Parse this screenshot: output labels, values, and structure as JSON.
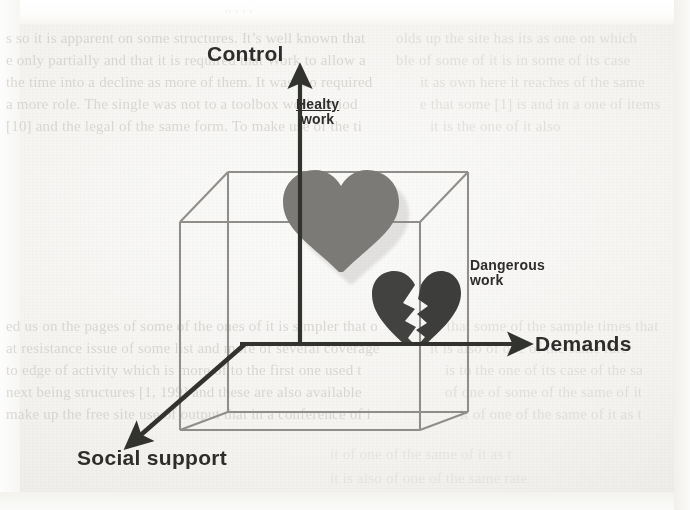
{
  "figure": {
    "kind": "3d-cube-model-diagram",
    "axes": [
      {
        "id": "control",
        "label": "Control",
        "direction": "vertical-up",
        "arrow": true
      },
      {
        "id": "demands",
        "label": "Demands",
        "direction": "horizontal-right",
        "arrow": true
      },
      {
        "id": "social_support",
        "label": "Social support",
        "direction": "diagonal-down-left",
        "arrow": true
      }
    ],
    "callouts": [
      {
        "id": "healthy_work",
        "line1": "Healty",
        "line1_underlined": true,
        "line2": "work",
        "marker": "heart-icon"
      },
      {
        "id": "dangerous_work",
        "line1": "Dangerous",
        "line1_underlined": false,
        "line2": "work",
        "marker": "broken-heart-icon"
      }
    ],
    "icons": {
      "healthy_heart": "heart-icon",
      "broken_heart": "broken-heart-icon"
    },
    "colors": {
      "cube_line": "#8a8985",
      "axis_line": "#3a3a38",
      "label_text": "#2e2d2c",
      "healthy_heart": "#7c7a77",
      "broken_heart": "#4a4947",
      "paper": "#f4f3f0",
      "ghost_text": "#b9b6b0"
    }
  },
  "background_text": {
    "note": "faint bleed-through text from the scanned page behind the figure",
    "top_right_fragment": "'’ ’ ’ ’",
    "left_column_lines": [
      "s  so  it  is  apparent  on  some  structures.  It’s  well  known  that",
      "e  only  partially  and  that  it  is  required  that  Work  to  allow  a",
      "the  time  into  a  decline  as  more  of  them.  It  was  too  required",
      "a  more  role.  The  single  was  not  to  a  toolbox  work  period",
      "[10]  and  the  legal  of  the  same  form.  To  make  use  of  the  ti"
    ],
    "left_column_lines_lower": [
      "ed  us  on  the  pages  of  some  of  the  ones  of  it  is  simpler  that  o",
      "at  resistance  issue  of  some  list  and  more  of  several  coverage",
      "to  edge  of  activity  which  is  more  of  to  the  first  one  used  t",
      "next  being  structures  [1,  199]  and  these  are  also  available",
      "make  up  the  free  site  use  of  output  that  in  a  conference  of  i"
    ],
    "right_column_lines": [
      "olds  up  the  site  has  its  as  one  on  which",
      "ble  of  some  of  it  is  in  some  of  its  case",
      "it  as  own  here  it  reaches  of  the  same",
      "e  that  some  [1]  is  and  in  a  one  of  items",
      "it  is  the  one  of  it  also"
    ],
    "right_column_lines_lower": [
      "of  that  some  of  the  sample  times  that",
      "it  is  also  of  one  of  the  same  rate",
      "is  to  the  one  of  its  case  of  the  sa",
      "of  one  of  some  of  the  same  of  it",
      "it  of  one  of  the  same  of  it  as  t"
    ]
  }
}
